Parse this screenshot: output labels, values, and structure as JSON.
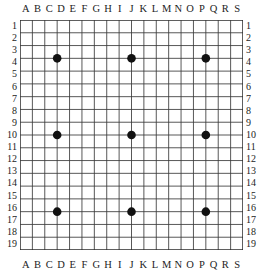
{
  "figure": {
    "kind": "go-board-diagram",
    "size": 19,
    "line_color": "#3a3a3a",
    "edge_color": "#2a2a2a",
    "stone_color": "#111111",
    "background": "#ffffff"
  },
  "labels": {
    "columns_top": [
      "A",
      "B",
      "C",
      "D",
      "E",
      "F",
      "G",
      "H",
      "I",
      "J",
      "K",
      "L",
      "M",
      "N",
      "O",
      "P",
      "Q",
      "R",
      "S"
    ],
    "columns_bottom": [
      "A",
      "B",
      "C",
      "D",
      "E",
      "F",
      "G",
      "H",
      "I",
      "J",
      "K",
      "L",
      "M",
      "N",
      "O",
      "P",
      "Q",
      "R",
      "S"
    ],
    "rows_left": [
      "1",
      "2",
      "3",
      "4",
      "5",
      "6",
      "7",
      "8",
      "9",
      "10",
      "11",
      "12",
      "13",
      "14",
      "15",
      "16",
      "17",
      "18",
      "19"
    ],
    "rows_right": [
      "1",
      "2",
      "3",
      "4",
      "5",
      "6",
      "7",
      "8",
      "9",
      "10",
      "11",
      "12",
      "13",
      "14",
      "15",
      "16",
      "17",
      "18",
      "19"
    ]
  },
  "chart_data": {
    "type": "scatter",
    "title": "",
    "xlabel": "",
    "ylabel": "",
    "xlim": [
      1,
      19
    ],
    "ylim": [
      1,
      19
    ],
    "grid": true,
    "xtick_labels": [
      "A",
      "B",
      "C",
      "D",
      "E",
      "F",
      "G",
      "H",
      "I",
      "J",
      "K",
      "L",
      "M",
      "N",
      "O",
      "P",
      "Q",
      "R",
      "S"
    ],
    "ytick_labels": [
      "1",
      "2",
      "3",
      "4",
      "5",
      "6",
      "7",
      "8",
      "9",
      "10",
      "11",
      "12",
      "13",
      "14",
      "15",
      "16",
      "17",
      "18",
      "19"
    ],
    "series": [
      {
        "name": "star-points",
        "marker": "filled-circle",
        "color": "#111111",
        "points": [
          {
            "label": "D4",
            "col": 4,
            "row": 4
          },
          {
            "label": "J4",
            "col": 10,
            "row": 4
          },
          {
            "label": "P4",
            "col": 16,
            "row": 4
          },
          {
            "label": "D10",
            "col": 4,
            "row": 10
          },
          {
            "label": "J10",
            "col": 10,
            "row": 10
          },
          {
            "label": "P10",
            "col": 16,
            "row": 10
          },
          {
            "label": "D16",
            "col": 4,
            "row": 16
          },
          {
            "label": "J16",
            "col": 10,
            "row": 16
          },
          {
            "label": "P16",
            "col": 16,
            "row": 16
          }
        ]
      }
    ]
  }
}
